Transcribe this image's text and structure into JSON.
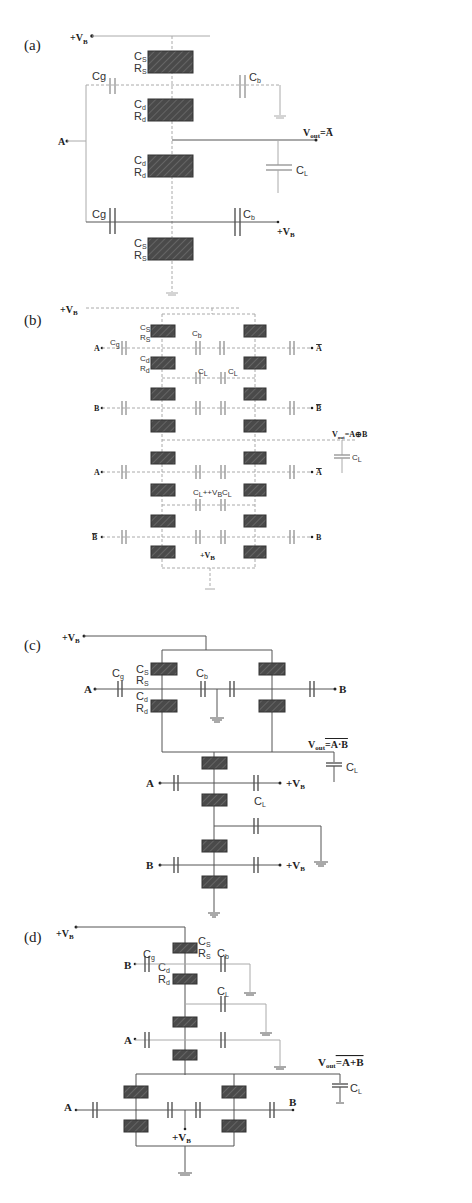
{
  "figure": {
    "panels": [
      {
        "id": "a",
        "label": "(a)",
        "supply": "+V",
        "supply_sub": "B",
        "input": "A",
        "output_label": "V",
        "output_sub": "out",
        "output_expr": "=A̅",
        "components": {
          "cs": "C",
          "cs_sub": "S",
          "rs": "R",
          "rs_sub": "S",
          "cd": "C",
          "cd_sub": "d",
          "rd": "R",
          "rd_sub": "d",
          "cg": "Cg",
          "cb": "C",
          "cb_sub": "b",
          "cl": "C",
          "cl_sub": "L",
          "bias": "+V",
          "bias_sub": "B"
        }
      },
      {
        "id": "b",
        "label": "(b)",
        "supply": "+V",
        "supply_sub": "B",
        "inputs": [
          "A",
          "B",
          "A",
          "B̅"
        ],
        "outputs": [
          "A̅",
          "B̅",
          "A̅",
          "B"
        ],
        "output_label": "V",
        "output_sub": "out",
        "output_expr": "=A⊕B",
        "components": {
          "cs": "C",
          "cs_sub": "S",
          "rs": "R",
          "rs_sub": "S",
          "cd": "C",
          "cd_sub": "d",
          "rd": "R",
          "rd_sub": "d",
          "cg": "C",
          "cg_sub": "g",
          "cb": "C",
          "cb_sub": "b",
          "cl": "C",
          "cl_sub": "L",
          "mid_label": "C",
          "mid_label_sub": "L",
          "mid_vb": "+V",
          "mid_vb_sub": "B",
          "bias": "+V",
          "bias_sub": "B"
        }
      },
      {
        "id": "c",
        "label": "(c)",
        "supply": "+V",
        "supply_sub": "B",
        "inputs": [
          "A",
          "B",
          "A",
          "B"
        ],
        "bias_terms": [
          "+V",
          "+V"
        ],
        "bias_sub": "B",
        "output_label": "V",
        "output_sub": "out",
        "output_expr": "=A·B",
        "components": {
          "cs": "C",
          "cs_sub": "S",
          "rs": "R",
          "rs_sub": "S",
          "cd": "C",
          "cd_sub": "d",
          "rd": "R",
          "rd_sub": "d",
          "cg": "C",
          "cg_sub": "g",
          "cb": "C",
          "cb_sub": "b",
          "cl": "C",
          "cl_sub": "L"
        }
      },
      {
        "id": "d",
        "label": "(d)",
        "supply": "+V",
        "supply_sub": "B",
        "inputs": [
          "B",
          "A",
          "A",
          "B"
        ],
        "output_label": "V",
        "output_sub": "out",
        "output_expr": "=A+B",
        "components": {
          "cs": "C",
          "cs_sub": "S",
          "rs": "R",
          "rs_sub": "S",
          "cd": "C",
          "cd_sub": "d",
          "rd": "R",
          "rd_sub": "d",
          "cg": "C",
          "cg_sub": "g",
          "cb": "C",
          "cb_sub": "b",
          "cl": "C",
          "cl_sub": "L",
          "bias": "+V",
          "bias_sub": "B"
        }
      }
    ]
  }
}
